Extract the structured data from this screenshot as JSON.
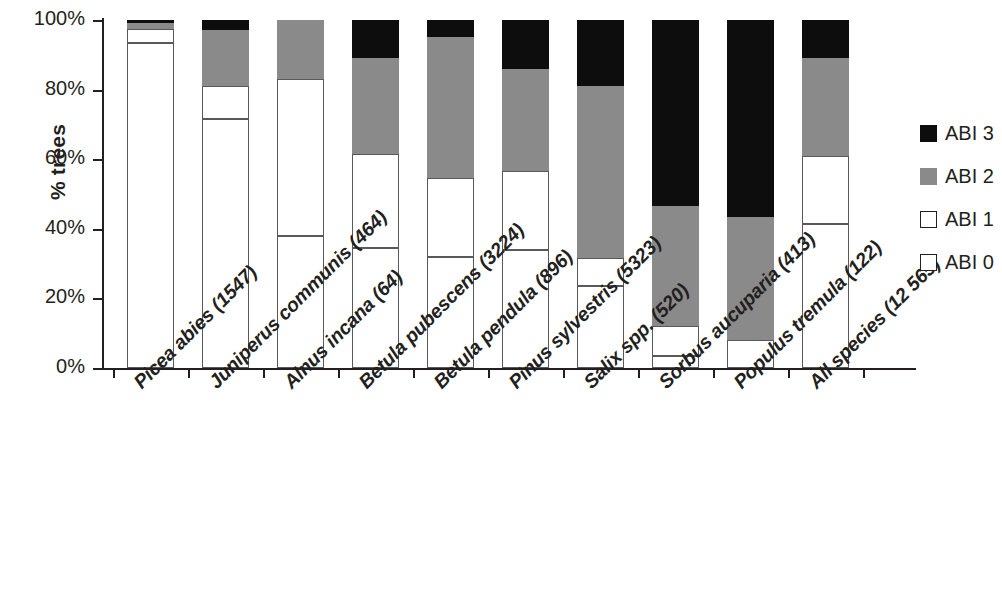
{
  "chart_data": {
    "type": "bar",
    "subtype": "stacked-percent",
    "title": "",
    "xlabel": "",
    "ylabel": "% trees",
    "ylim": [
      0,
      100
    ],
    "ytick_labels": [
      "100%",
      "80%",
      "60%",
      "40%",
      "20%",
      "0%"
    ],
    "ytick_values": [
      100,
      80,
      60,
      40,
      20,
      0
    ],
    "grid": false,
    "legend_position": "right",
    "categories": [
      "Picea abies (1547)",
      "Juniperus communis (464)",
      "Alnus incana (64)",
      "Betula pubescens (3224)",
      "Betula pendula (896)",
      "Pinus sylvestris (5323)",
      "Salix spp. (520)",
      "Sorbus aucuparia (413)",
      "Populus tremula (122)",
      "All species (12 565)"
    ],
    "series": [
      {
        "name": "ABI 0",
        "color": "#ffffff",
        "values": [
          93.5,
          71.5,
          38,
          34.5,
          32,
          34,
          23.5,
          3.5,
          8,
          41.5
        ]
      },
      {
        "name": "ABI 1",
        "color": "#ffffff",
        "values": [
          4,
          9.5,
          45,
          27,
          22.5,
          22.5,
          8,
          8.5,
          0,
          19.5
        ]
      },
      {
        "name": "ABI 2",
        "color": "#8a8a8a",
        "values": [
          1.5,
          16,
          17,
          27.5,
          40.5,
          29.5,
          49.5,
          34.5,
          35.5,
          28
        ]
      },
      {
        "name": "ABI 3",
        "color": "#0d0d0d",
        "values": [
          1,
          3,
          0,
          11,
          5,
          14,
          19,
          53.5,
          56.5,
          11
        ]
      }
    ],
    "legend": [
      "ABI 3",
      "ABI 2",
      "ABI 1",
      "ABI 0"
    ]
  },
  "colors": {
    "abi3": "#0d0d0d",
    "abi2": "#8a8a8a",
    "abi1": "#ffffff",
    "abi0": "#ffffff",
    "axis": "#231f20"
  }
}
